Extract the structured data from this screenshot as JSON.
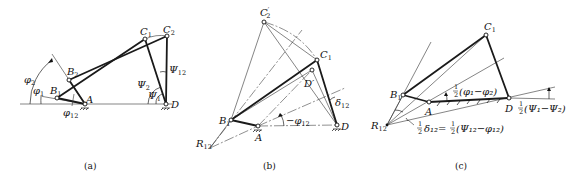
{
  "figure": {
    "colors": {
      "lines": "#1a1a1a",
      "background": "#ffffff"
    },
    "panels": [
      {
        "id": "a",
        "caption": "(a)",
        "points": {
          "A": "A",
          "D": "D",
          "B1": "B",
          "B1_sub": "1",
          "B2": "B",
          "B2_sub": "2",
          "C1": "C",
          "C1_sub": "1",
          "C2": "C",
          "C2_sub": "2"
        },
        "angles": {
          "phi2": "φ",
          "phi2_sub": "2",
          "phi1": "φ",
          "phi1_sub": "1",
          "phi12": "φ",
          "phi12_sub": "12",
          "psi12": "Ψ",
          "psi12_sub": "12",
          "psi2": "Ψ",
          "psi2_sub": "2",
          "psi1": "Ψ",
          "psi1_sub": "1"
        }
      },
      {
        "id": "b",
        "caption": "(b)",
        "points": {
          "A": "A",
          "D": "D",
          "B1": "B",
          "B1_sub": "1",
          "C2p": "C",
          "C2p_sub": "2",
          "C2p_prime": "′",
          "C1": "C",
          "C1_sub": "1",
          "Dp": "D′",
          "R12": "R",
          "R12_sub": "12",
          "B12": "B",
          "B12_sub": "12"
        },
        "angles": {
          "neg_phi12": "−φ",
          "neg_phi12_sub": "12",
          "delta12": "δ",
          "delta12_sub": "12"
        }
      },
      {
        "id": "c",
        "caption": "(c)",
        "points": {
          "A": "A",
          "D": "D",
          "B1": "B",
          "B1_sub": "1",
          "C1": "C",
          "C1_sub": "1",
          "R12": "R",
          "R12_sub": "12"
        },
        "angles": {
          "half_phi_diff": "(φ₁−φ₂)",
          "half_psi_diff": "(Ψ₁−Ψ₂)",
          "half_delta": "δ₁₂=",
          "half_delta_rhs": "(Ψ₁₂−φ₁₂)",
          "half_num": "1",
          "half_den": "2"
        }
      }
    ]
  }
}
